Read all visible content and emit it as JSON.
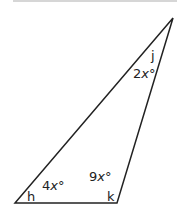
{
  "diagram": {
    "type": "triangle",
    "stroke_color": "#222222",
    "vertices": {
      "h": {
        "label": "h",
        "angle_expr": "4x°",
        "coef": "4",
        "var": "x",
        "deg": "°"
      },
      "k": {
        "label": "k",
        "angle_expr": "9x°",
        "coef": "9",
        "var": "x",
        "deg": "°"
      },
      "j": {
        "label": "j",
        "angle_expr": "2x°",
        "coef": "2",
        "var": "x",
        "deg": "°"
      }
    }
  }
}
